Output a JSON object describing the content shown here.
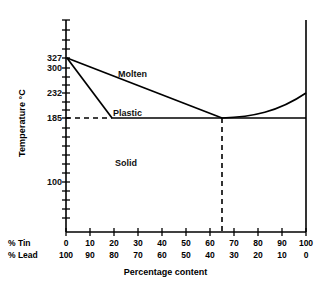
{
  "chart_data": {
    "type": "line",
    "title": "",
    "subtitle": "",
    "xlabel": "Percentage  content",
    "ylabel": "Temperature  °C",
    "xlim": [
      0,
      100
    ],
    "ylim": [
      0,
      380
    ],
    "grid": false,
    "legend_position": "none",
    "axes": {
      "y_tick_labels": [
        "327",
        "300",
        "232",
        "185",
        "100"
      ],
      "y_tick_values": [
        327,
        300,
        232,
        185,
        100
      ],
      "x_axis_primary_label": "% Tin",
      "x_axis_secondary_label": "% Lead",
      "x_tick_values_tin": [
        0,
        10,
        20,
        30,
        40,
        50,
        60,
        70,
        80,
        90,
        100
      ],
      "x_tick_labels_tin": [
        "0",
        "10",
        "20",
        "30",
        "40",
        "50",
        "60",
        "70",
        "80",
        "90",
        "100"
      ],
      "x_tick_values_lead": [
        100,
        90,
        80,
        70,
        60,
        50,
        40,
        30,
        20,
        10,
        0
      ],
      "x_tick_labels_lead": [
        "100",
        "90",
        "80",
        "70",
        "60",
        "50",
        "40",
        "30",
        "20",
        "10",
        "0"
      ]
    },
    "annotations": [
      {
        "text": "Molten",
        "x_percent_tin": 26,
        "y_temp": 293
      },
      {
        "text": "Plastic",
        "x_percent_tin": 22,
        "y_temp": 226
      },
      {
        "text": "Solid",
        "x_percent_tin": 23,
        "y_temp": 143
      }
    ],
    "series": [
      {
        "name": "liquidus-left",
        "comment": "Liquidus from pure lead melting point down to eutectic",
        "points": [
          [
            0,
            327
          ],
          [
            65,
            185
          ]
        ]
      },
      {
        "name": "solidus-left",
        "comment": "Solidus from pure lead melting point to solid solution limit",
        "points": [
          [
            0,
            327
          ],
          [
            19,
            185
          ]
        ]
      },
      {
        "name": "liquidus-right",
        "comment": "Liquidus from eutectic rising to pure tin melting point",
        "points": [
          [
            65,
            185
          ],
          [
            75,
            187
          ],
          [
            83,
            193
          ],
          [
            90,
            203
          ],
          [
            95,
            213
          ],
          [
            100,
            232
          ]
        ]
      },
      {
        "name": "eutectic-horizontal",
        "comment": "Eutectic isotherm at 185 C across the diagram",
        "points": [
          [
            19,
            185
          ],
          [
            100,
            185
          ]
        ]
      }
    ],
    "reference_lines": [
      {
        "name": "eutectic-temperature-dashed",
        "orientation": "horizontal",
        "value": 185,
        "from_percent_tin": 0,
        "to_percent_tin": 19,
        "style": "dashed"
      },
      {
        "name": "eutectic-composition-dashed",
        "orientation": "vertical",
        "percent_tin": 65,
        "from_temp": 0,
        "to_temp": 185,
        "style": "dashed"
      }
    ],
    "key_points": {
      "lead_melting_point_c": 327,
      "tin_melting_point_c": 232,
      "eutectic_temperature_c": 185,
      "eutectic_composition_percent_tin": 65,
      "eutectic_composition_percent_lead": 35
    },
    "colors": {
      "line": "#000000",
      "axis": "#000000",
      "text": "#111111",
      "background": "#ffffff"
    }
  },
  "labels": {
    "y_title": "Temperature  °C",
    "x_title": "Percentage  content",
    "tin_caption": "% Tin",
    "lead_caption": "% Lead",
    "region_molten": "Molten",
    "region_plastic": "Plastic",
    "region_solid": "Solid",
    "y_327": "327",
    "y_300": "300",
    "y_232": "232",
    "y_185": "185",
    "y_100": "100"
  }
}
